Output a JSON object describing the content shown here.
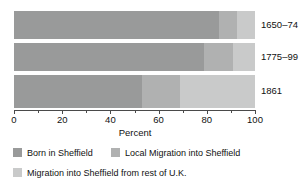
{
  "chart_data": {
    "type": "bar",
    "orientation": "horizontal",
    "stacked": true,
    "percent_stacked": true,
    "title": "",
    "xlabel": "Percent",
    "ylabel": "",
    "xlim": [
      0,
      100
    ],
    "xticks": [
      0,
      20,
      40,
      60,
      80,
      100
    ],
    "xtick_labels": [
      "0",
      "20",
      "40",
      "60",
      "80",
      "100"
    ],
    "minor_xticks": [
      10,
      30,
      50,
      70,
      90
    ],
    "grid": false,
    "legend_position": "bottom-left",
    "categories": [
      "1650–74",
      "1775–99",
      "1861"
    ],
    "series": [
      {
        "name": "Born in Sheffield",
        "color": "#999a9a",
        "values": [
          85,
          79,
          53
        ]
      },
      {
        "name": "Local Migration into Sheffield",
        "color": "#b0b1b1",
        "values": [
          7.5,
          12,
          16
        ]
      },
      {
        "name": "Migration into Sheffield from rest of U.K.",
        "color": "#c9caca",
        "values": [
          7.5,
          9,
          31
        ]
      }
    ]
  },
  "axis": {
    "xlabel": "Percent",
    "ticks": [
      {
        "value": 0,
        "label": "0"
      },
      {
        "value": 20,
        "label": "20"
      },
      {
        "value": 40,
        "label": "40"
      },
      {
        "value": 60,
        "label": "60"
      },
      {
        "value": 80,
        "label": "80"
      },
      {
        "value": 100,
        "label": "100"
      }
    ]
  },
  "categories": [
    {
      "label": "1650–74"
    },
    {
      "label": "1775–99"
    },
    {
      "label": "1861"
    }
  ],
  "legend": [
    {
      "label": "Born in Sheffield",
      "color": "#999a9a"
    },
    {
      "label": "Local Migration into Sheffield",
      "color": "#b0b1b1"
    },
    {
      "label": "Migration into Sheffield from rest of U.K.",
      "color": "#c9caca"
    }
  ],
  "colors": {
    "series_dark": "#999a9a",
    "series_medium": "#b0b1b1",
    "series_light": "#c9caca",
    "axis": "#4a4a4a",
    "text": "#111111",
    "background": "#ffffff"
  }
}
